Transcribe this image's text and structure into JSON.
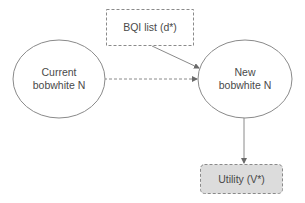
{
  "diagram": {
    "type": "influence-diagram",
    "colors": {
      "stroke": "#8a8a8a",
      "text": "#4a4a4a",
      "utility_fill": "#dcdcdc",
      "background": "#ffffff"
    },
    "nodes": {
      "bqi_list": {
        "kind": "decision",
        "shape": "rectangle-dashed",
        "label": "BQI list (d*)"
      },
      "current_n": {
        "kind": "chance",
        "shape": "ellipse",
        "label_line1": "Current",
        "label_line2": "bobwhite N"
      },
      "new_n": {
        "kind": "chance",
        "shape": "ellipse",
        "label_line1": "New",
        "label_line2": "bobwhite N"
      },
      "utility": {
        "kind": "utility",
        "shape": "rounded-rectangle-filled",
        "label": "Utility (V*)"
      }
    },
    "edges": [
      {
        "from": "current_n",
        "to": "new_n",
        "style": "dashed"
      },
      {
        "from": "bqi_list",
        "to": "new_n",
        "style": "solid"
      },
      {
        "from": "new_n",
        "to": "utility",
        "style": "solid"
      }
    ]
  }
}
